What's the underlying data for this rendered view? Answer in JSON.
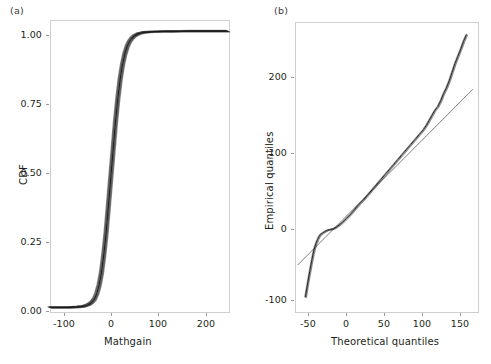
{
  "figure": {
    "background": "#ffffff",
    "panel_border_color": "#cfcfcf",
    "data_color": "#1a1a1a",
    "reference_color": "#555555"
  },
  "panels": [
    {
      "tag": "(a)",
      "name": "ecdf-panel",
      "xlabel": "Mathgain",
      "ylabel": "CDF",
      "xticks": [
        "-100",
        "0",
        "100",
        "200"
      ],
      "yticks": [
        "1.00",
        "0.75",
        "0.50",
        "0.25",
        "0.00"
      ]
    },
    {
      "tag": "(b)",
      "name": "qq-panel",
      "xlabel": "Theoretical quantiles",
      "ylabel": "Empirical quantiles",
      "xticks": [
        "-50",
        "0",
        "50",
        "100",
        "150"
      ],
      "yticks": [
        "200",
        "100",
        "0",
        "-100"
      ]
    }
  ],
  "chart_data": [
    {
      "type": "line",
      "name": "ecdf",
      "title": "(a)",
      "xlabel": "Mathgain",
      "ylabel": "CDF",
      "xlim": [
        -120,
        265
      ],
      "ylim": [
        -0.02,
        1.04
      ],
      "xticks": [
        -100,
        0,
        100,
        200
      ],
      "yticks": [
        0.0,
        0.25,
        0.5,
        0.75,
        1.0
      ],
      "grid": false,
      "legend": null,
      "description": "Empirical cumulative distribution function of Mathgain; thick near-black band formed by many overlaid curves.",
      "x": [
        -120,
        -110,
        -100,
        -90,
        -80,
        -70,
        -60,
        -55,
        -50,
        -45,
        -40,
        -35,
        -30,
        -25,
        -20,
        -15,
        -10,
        -5,
        0,
        5,
        10,
        15,
        20,
        25,
        30,
        35,
        40,
        45,
        50,
        55,
        60,
        65,
        70,
        75,
        80,
        90,
        100,
        120,
        140,
        160,
        180,
        200,
        220,
        240,
        260
      ],
      "y": [
        0.0,
        0.0,
        0.0,
        0.0,
        0.0,
        0.001,
        0.002,
        0.003,
        0.004,
        0.006,
        0.009,
        0.013,
        0.02,
        0.03,
        0.05,
        0.08,
        0.125,
        0.19,
        0.27,
        0.37,
        0.47,
        0.57,
        0.67,
        0.755,
        0.825,
        0.878,
        0.917,
        0.944,
        0.962,
        0.974,
        0.982,
        0.987,
        0.991,
        0.993,
        0.995,
        0.9965,
        0.9975,
        0.9985,
        0.999,
        0.9993,
        0.9995,
        0.9997,
        0.9998,
        0.9999,
        1.0
      ]
    },
    {
      "type": "line",
      "name": "qq-plot",
      "title": "(b)",
      "xlabel": "Theoretical quantiles",
      "ylabel": "Empirical quantiles",
      "xlim": [
        -72,
        185
      ],
      "ylim": [
        -135,
        270
      ],
      "xticks": [
        -50,
        0,
        50,
        100,
        150
      ],
      "yticks": [
        -100,
        0,
        100,
        200
      ],
      "grid": false,
      "legend": null,
      "description": "Normal Q-Q plot: sample quantiles versus theoretical quantiles, with a straight reference line. Heavy departure below the line in the lower-left tail and a convex bend above the line in the upper-right tail.",
      "series": [
        {
          "name": "sample-quantiles",
          "x": [
            -57,
            -54,
            -51,
            -48,
            -46,
            -44,
            -42,
            -40,
            -38,
            -36,
            -33,
            -30,
            -26,
            -22,
            -18,
            -14,
            -10,
            -5,
            0,
            6,
            12,
            18,
            24,
            30,
            36,
            42,
            48,
            54,
            60,
            66,
            72,
            78,
            84,
            90,
            96,
            102,
            108,
            112,
            116,
            120,
            124,
            128,
            132,
            136,
            140,
            144,
            148,
            152,
            156,
            160,
            164,
            168
          ],
          "y": [
            -113,
            -95,
            -78,
            -62,
            -52,
            -44,
            -38,
            -33,
            -29,
            -26,
            -24,
            -22,
            -20,
            -19,
            -18,
            -16,
            -13,
            -9,
            -4,
            2,
            9,
            16,
            22,
            29,
            36,
            43,
            50,
            57,
            64,
            71,
            78,
            85,
            92,
            99,
            106,
            113,
            120,
            126,
            133,
            140,
            147,
            152,
            160,
            170,
            178,
            188,
            200,
            212,
            222,
            232,
            243,
            252
          ]
        },
        {
          "name": "reference-line",
          "x": [
            -68,
            176
          ],
          "y": [
            -68,
            176
          ]
        }
      ]
    }
  ]
}
